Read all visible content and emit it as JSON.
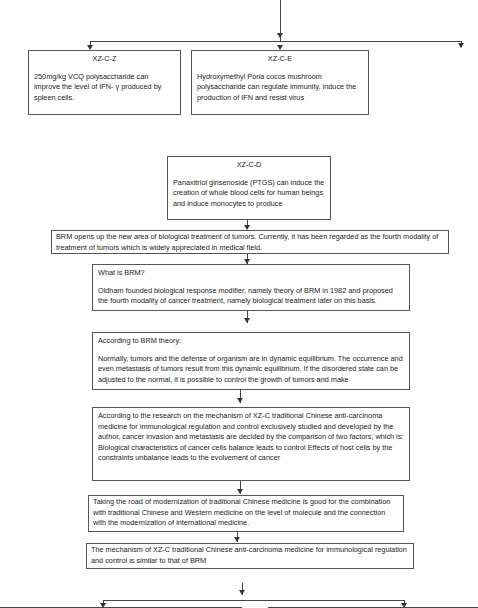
{
  "top_branch": {
    "boxes": [
      {
        "title": "XZ-C-Z",
        "text": "250mg/kg VCQ polysaccharide can improve the level of IFN- γ produced by spleen cells."
      },
      {
        "title": "XZ-C-E",
        "text": "Hydroxymethyl Poria cocos mushroom polysaccharide can regulate immunity, induce the production of IFN and resist virus"
      }
    ]
  },
  "middle_box": {
    "title": "XZ-C-D",
    "text": "Panaxitriol ginsenoside (PTGS) can induce the creation of whole blood cells for human beings and induce monocytes to produce"
  },
  "flow": [
    {
      "text": "BRM opens up the new area of biological treatment of tumors. Currently, it has been regarded as the fourth modality of treatment of tumors which is widely appreciated in medical field."
    },
    {
      "title": "What is BRM?",
      "text": "Oldham founded biological response modifier, namely theory of BRM in 1982 and proposed the fourth modality of cancer treatment, namely biological treatment later on this basis."
    },
    {
      "title": "According to BRM theory:",
      "text": "Normally, tumors and the defense of organism are in dynamic equilibrium. The occurrence and even metastasis of tumors result from this dynamic equilibrium. If the disordered state can be adjusted to the normal, it is possible to control the growth of tumors and make"
    },
    {
      "text": "According to the research on the mechanism of XZ-C traditional Chinese anti-carcinoma medicine for immunological regulation and control exclusively studied and developed by the author, cancer invasion and metastasis are decided by the comparison of two factors, which is: Biological characteristics of cancer cells   balance leads to control Effects of host cells by the constraints     unbalance leads to the evolvement of cancer"
    },
    {
      "text": "Taking the road of modernization of traditional Chinese medicine is good for the combination with traditional Chinese and Western medicine on the level of molecule and the connection with the modernization of international medicine."
    },
    {
      "text": "The mechanism of XZ-C traditional Chinese anti-carcinoma medicine for immunological regulation and control is similar to that of BRM"
    }
  ]
}
